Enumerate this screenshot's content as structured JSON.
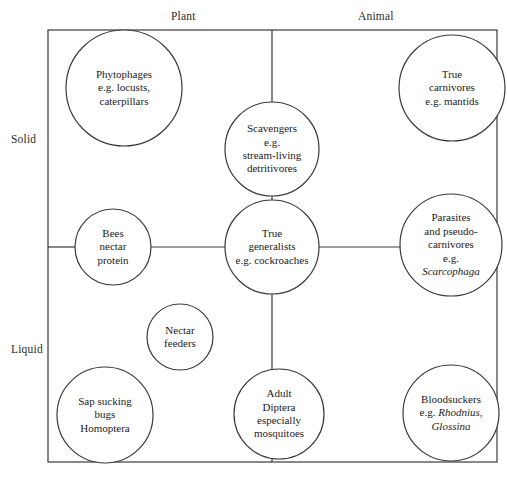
{
  "diagram": {
    "axes": {
      "top": [
        {
          "label": "Plant",
          "x": 190,
          "y": 16
        },
        {
          "label": "Animal",
          "x": 380,
          "y": 16
        }
      ],
      "left": [
        {
          "label": "Solid",
          "x": 27,
          "y": 140
        },
        {
          "label": "Liquid",
          "x": 27,
          "y": 350
        }
      ]
    },
    "frame": {
      "x": 48,
      "y": 30,
      "width": 449,
      "height": 432,
      "stroke": "#3a3a3a",
      "stroke_width": 1.2
    },
    "divider_x": 272,
    "connector_y": 247,
    "nodes": [
      {
        "id": "phytophages",
        "name": "phytophages",
        "cx": 124,
        "cy": 88,
        "r": 58,
        "lines": [
          "Phytophages",
          "e.g. locusts,",
          "caterpillars"
        ],
        "italic": []
      },
      {
        "id": "true-carnivores",
        "name": "true-carnivores",
        "cx": 452,
        "cy": 88,
        "r": 53,
        "lines": [
          "True",
          "carnivores",
          "e.g. mantids"
        ],
        "italic": []
      },
      {
        "id": "scavengers",
        "name": "scavengers",
        "cx": 272,
        "cy": 149,
        "r": 47,
        "lines": [
          "Scavengers",
          "e.g.",
          "stream-living",
          "detritivores"
        ],
        "italic": []
      },
      {
        "id": "bees",
        "name": "bees-nectar-protein",
        "cx": 113,
        "cy": 247,
        "r": 38,
        "lines": [
          "Bees",
          "nectar",
          "protein"
        ],
        "italic": []
      },
      {
        "id": "true-generalists",
        "name": "true-generalists",
        "cx": 272,
        "cy": 247,
        "r": 47,
        "lines": [
          "True",
          "generalists",
          "e.g. cockroaches"
        ],
        "italic": []
      },
      {
        "id": "parasites",
        "name": "parasites-and-pseudo-carnivores",
        "cx": 451,
        "cy": 245,
        "r": 51,
        "lines": [
          "Parasites",
          "and pseudo-",
          "carnivores",
          "e.g.",
          "Scarcophaga"
        ],
        "italic": [
          "Scarcophaga"
        ]
      },
      {
        "id": "nectar-feeders",
        "name": "nectar-feeders",
        "cx": 180,
        "cy": 337,
        "r": 33,
        "lines": [
          "Nectar",
          "feeders"
        ],
        "italic": []
      },
      {
        "id": "sap-sucking",
        "name": "sap-sucking-bugs",
        "cx": 105,
        "cy": 415,
        "r": 48,
        "lines": [
          "Sap sucking",
          "bugs",
          "Homoptera"
        ],
        "italic": []
      },
      {
        "id": "adult-diptera",
        "name": "adult-diptera",
        "cx": 279,
        "cy": 414,
        "r": 45,
        "lines": [
          "Adult",
          "Diptera",
          "especially",
          "mosquitoes"
        ],
        "italic": []
      },
      {
        "id": "bloodsuckers",
        "name": "bloodsuckers",
        "cx": 451,
        "cy": 413,
        "r": 48,
        "lines": [
          "Bloodsuckers",
          "e.g. Rhodnius,",
          "Glossina"
        ],
        "italic": [
          "Rhodnius,",
          "Glossina"
        ]
      }
    ],
    "connectors": [
      {
        "name": "divider-top",
        "x1": 272,
        "y1": 30,
        "x2": 272,
        "y2": 102
      },
      {
        "name": "scavengers-to-generalists",
        "x1": 272,
        "y1": 196,
        "x2": 272,
        "y2": 200
      },
      {
        "name": "frame-left-to-bees",
        "x1": 48,
        "y1": 247,
        "x2": 75,
        "y2": 247
      },
      {
        "name": "bees-to-generalists",
        "x1": 151,
        "y1": 247,
        "x2": 225,
        "y2": 247
      },
      {
        "name": "generalists-to-parasites",
        "x1": 319,
        "y1": 247,
        "x2": 400,
        "y2": 247
      },
      {
        "name": "generalists-to-diptera",
        "x1": 272,
        "y1": 294,
        "x2": 272,
        "y2": 371
      },
      {
        "name": "diptera-to-frame-bottom",
        "x1": 272,
        "y1": 458,
        "x2": 272,
        "y2": 462
      }
    ]
  }
}
